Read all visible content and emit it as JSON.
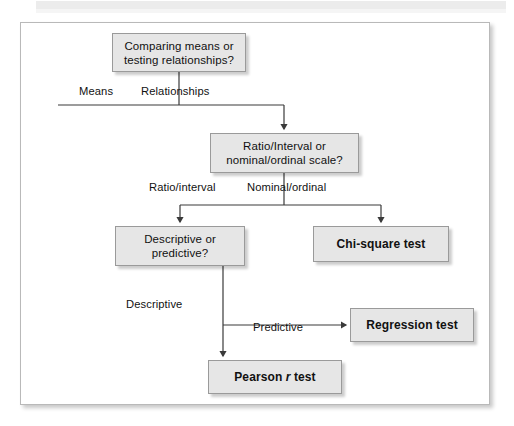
{
  "figure": {
    "type": "flowchart",
    "nodes": [
      {
        "id": "root",
        "label": "Comparing means or testing relationships?",
        "style": "decision"
      },
      {
        "id": "scale",
        "label": "Ratio/Interval or nominal/ordinal scale?",
        "style": "decision"
      },
      {
        "id": "descpred",
        "label": "Descriptive or predictive?",
        "style": "decision"
      },
      {
        "id": "chisq",
        "label": "Chi-square test",
        "style": "terminal"
      },
      {
        "id": "regress",
        "label": "Regression test",
        "style": "terminal"
      },
      {
        "id": "pearson",
        "label": "Pearson r test",
        "style": "terminal",
        "italic_part": "r"
      }
    ],
    "edge_labels": {
      "means": "Means",
      "relationships": "Relationships",
      "ratio_interval": "Ratio/interval",
      "nominal_ordinal": "Nominal/ordinal",
      "descriptive": "Descriptive",
      "predictive": "Predictive"
    },
    "node_text": {
      "root_line1": "Comparing means or",
      "root_line2": "testing relationships?",
      "scale_line1": "Ratio/Interval or",
      "scale_line2": "nominal/ordinal scale?",
      "descpred_line1": "Descriptive or",
      "descpred_line2": "predictive?",
      "chisq": "Chi-square test",
      "regress": "Regression test",
      "pearson_pre": "Pearson ",
      "pearson_italic": "r",
      "pearson_post": " test"
    },
    "colors": {
      "node_fill": "#e6e6e6",
      "node_border": "#9a9a9a",
      "connector": "#3a3a3a",
      "frame_border": "#b9b9b9",
      "page_background": "#ffffff",
      "text": "#111111"
    }
  }
}
